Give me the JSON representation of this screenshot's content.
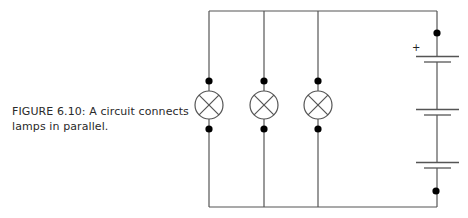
{
  "figure": {
    "caption_line1": "FIGURE 6.10: A circuit connects",
    "caption_line2": "lamps in parallel.",
    "caption_full": "FIGURE 6.10: A circuit connects lamps in parallel."
  },
  "circuit": {
    "description": "Parallel circuit with three lamps and a three-cell battery",
    "lamps": [
      {
        "label": "lamp-1",
        "type": "lamp"
      },
      {
        "label": "lamp-2",
        "type": "lamp"
      },
      {
        "label": "lamp-3",
        "type": "lamp"
      }
    ],
    "battery": {
      "cells": 3,
      "positive_terminal_label": "+"
    },
    "colors": {
      "wire": "#555555",
      "node": "#000000",
      "text": "#2a2a2a"
    }
  }
}
